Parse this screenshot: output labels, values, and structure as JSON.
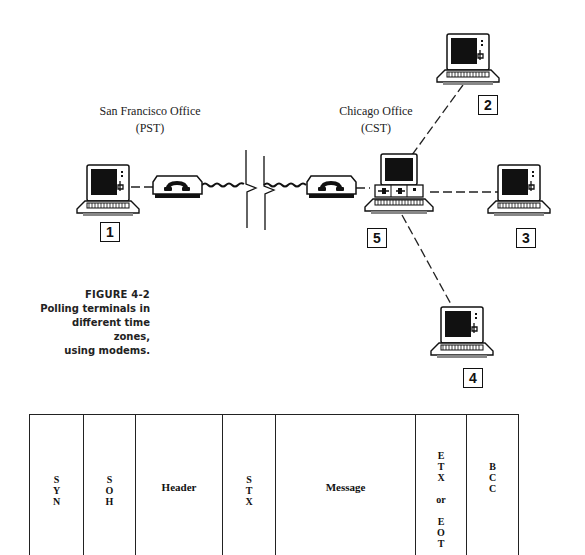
{
  "diagram": {
    "offices": [
      {
        "name": "San Francisco Office",
        "timezone": "(PST)"
      },
      {
        "name": "Chicago Office",
        "timezone": "(CST)"
      }
    ],
    "terminals": [
      {
        "id": "1",
        "label": "1",
        "location": "San Francisco Office"
      },
      {
        "id": "2",
        "label": "2",
        "location": "Chicago Office"
      },
      {
        "id": "3",
        "label": "3",
        "location": "Chicago Office"
      },
      {
        "id": "4",
        "label": "4",
        "location": "Chicago Office"
      },
      {
        "id": "5",
        "label": "5",
        "location": "Chicago Office",
        "role": "polling controller"
      }
    ],
    "devices": [
      "modem-sf",
      "modem-chicago"
    ],
    "connections": [
      {
        "from": "1",
        "to": "modem-sf",
        "style": "dashed"
      },
      {
        "from": "modem-sf",
        "to": "modem-chicago",
        "style": "phone-line-broken"
      },
      {
        "from": "modem-chicago",
        "to": "5",
        "style": "dashed"
      },
      {
        "from": "5",
        "to": "2",
        "style": "dashed"
      },
      {
        "from": "5",
        "to": "3",
        "style": "dashed"
      },
      {
        "from": "5",
        "to": "4",
        "style": "dashed"
      }
    ]
  },
  "caption": {
    "figure": "FIGURE 4-2",
    "lines": [
      "Polling terminals in",
      "different time zones,",
      "using modems."
    ]
  },
  "frame": {
    "fields": [
      {
        "id": "syn",
        "text": "S\nY\nN"
      },
      {
        "id": "soh",
        "text": "S\nO\nH"
      },
      {
        "id": "header",
        "text": "Header"
      },
      {
        "id": "stx",
        "text": "S\nT\nX"
      },
      {
        "id": "message",
        "text": "Message"
      },
      {
        "id": "etx-eot",
        "text": "E\nT\nX\n\nor\n\nE\nO\nT"
      },
      {
        "id": "bcc",
        "text": "B\nC\nC"
      }
    ]
  }
}
